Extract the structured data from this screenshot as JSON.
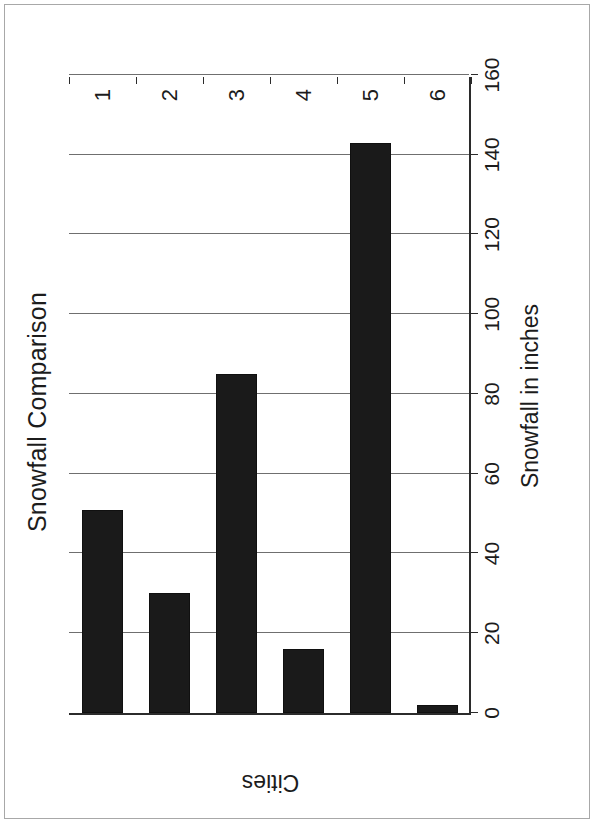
{
  "document": {
    "kind": "scanned-chart-page",
    "rotation": "90deg-counter-clockwise",
    "frame_color": "#a8a8a8",
    "background_color": "#ffffff"
  },
  "chart_data": {
    "type": "bar",
    "orientation": "vertical",
    "title": "Snowfall Comparison",
    "xlabel": "Cities",
    "ylabel": "Snowfall in inches",
    "categories": [
      "1",
      "2",
      "3",
      "4",
      "5",
      "6"
    ],
    "values": [
      51,
      30,
      85,
      16,
      143,
      2
    ],
    "ylim": [
      0,
      160
    ],
    "ytick_step": 20,
    "yticks": [
      0,
      20,
      40,
      60,
      80,
      100,
      120,
      140,
      160
    ],
    "ytick_labels": [
      "0",
      "20",
      "40",
      "60",
      "80",
      "100",
      "120",
      "140",
      "160"
    ],
    "grid": "major-y-only",
    "legend": "none",
    "bar_color": "#1a1a1a",
    "gridline_color": "#6f6f6f",
    "axis_color": "#2b2b2b"
  }
}
